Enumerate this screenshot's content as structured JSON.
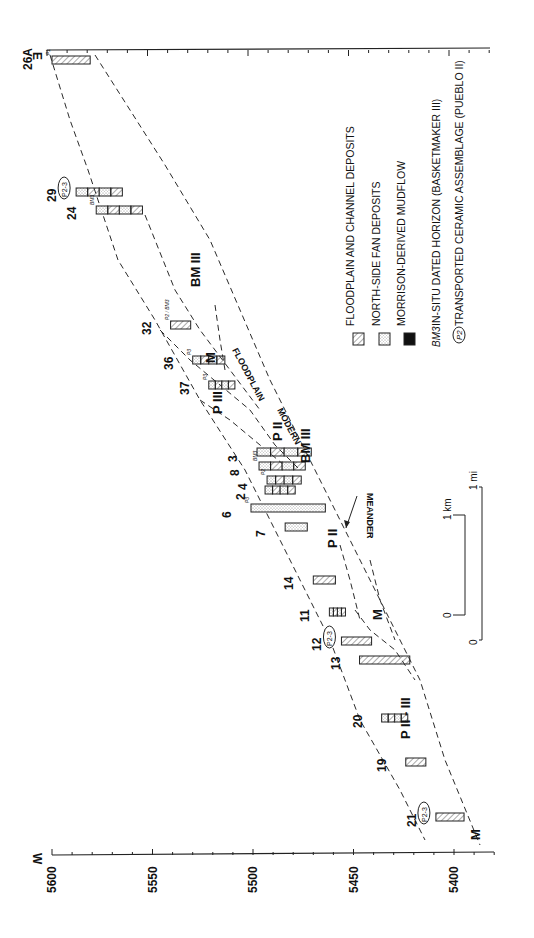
{
  "figure": {
    "orientation": "rotated-90-clockwise",
    "elevation_axis": {
      "tick_labels": [
        "5600",
        "5550",
        "5500",
        "5450",
        "5400"
      ],
      "min": 5380,
      "max": 5600,
      "west_label": "W",
      "east_label": "E"
    },
    "sections": [
      {
        "id": "26A",
        "label": "26A",
        "pos": 60,
        "top": 5600,
        "bottom": 5581,
        "fill": "floodplain",
        "annot": "P1"
      },
      {
        "id": "29",
        "label": "29",
        "pos": 192,
        "top": 5588,
        "bottom": 5565,
        "fill": "mixed",
        "annot": "P2-3"
      },
      {
        "id": "24",
        "label": "24",
        "pos": 210,
        "top": 5578,
        "bottom": 5555,
        "fill": "mixed",
        "annot": "BM3"
      },
      {
        "id": "32",
        "label": "32",
        "pos": 325,
        "top": 5541,
        "bottom": 5531,
        "fill": "floodplain",
        "annot": "P2 / BM3"
      },
      {
        "id": "36",
        "label": "36",
        "pos": 360,
        "top": 5530,
        "bottom": 5514,
        "fill": "mixed",
        "annot": "P3"
      },
      {
        "id": "37",
        "label": "37",
        "pos": 385,
        "top": 5522,
        "bottom": 5509,
        "fill": "mixed",
        "annot": "P3"
      },
      {
        "id": "3",
        "label": "3",
        "pos": 452,
        "top": 5498,
        "bottom": 5471,
        "fill": "mixed"
      },
      {
        "id": "8",
        "label": "8",
        "pos": 466,
        "top": 5497,
        "bottom": 5474,
        "fill": "mixed",
        "annot": "BM3"
      },
      {
        "id": "4",
        "label": "4",
        "pos": 480,
        "top": 5493,
        "bottom": 5476,
        "fill": "mixed",
        "annot": "P2"
      },
      {
        "id": "2",
        "label": "2",
        "pos": 490,
        "top": 5494,
        "bottom": 5479,
        "fill": "mixed"
      },
      {
        "id": "6",
        "label": "6",
        "pos": 508,
        "top": 5501,
        "bottom": 5464,
        "fill": "fan",
        "annot": "P3"
      },
      {
        "id": "7",
        "label": "7",
        "pos": 527,
        "top": 5484,
        "bottom": 5473,
        "fill": "fan"
      },
      {
        "id": "14",
        "label": "14",
        "pos": 580,
        "top": 5470,
        "bottom": 5459,
        "fill": "floodplain"
      },
      {
        "id": "11",
        "label": "11",
        "pos": 612,
        "top": 5462,
        "bottom": 5454,
        "fill": "mixed"
      },
      {
        "id": "12",
        "label": "12",
        "pos": 641,
        "top": 5456,
        "bottom": 5441,
        "fill": "floodplain",
        "annot": "P2-3"
      },
      {
        "id": "13",
        "label": "13",
        "pos": 660,
        "top": 5447,
        "bottom": 5422,
        "fill": "floodplain"
      },
      {
        "id": "20",
        "label": "20",
        "pos": 718,
        "top": 5436,
        "bottom": 5423,
        "fill": "mixed"
      },
      {
        "id": "19",
        "label": "19",
        "pos": 762,
        "top": 5424,
        "bottom": 5414,
        "fill": "floodplain"
      },
      {
        "id": "21",
        "label": "21",
        "pos": 817,
        "top": 5409,
        "bottom": 5395,
        "fill": "floodplain",
        "annot": "P2-3"
      }
    ],
    "unit_labels": [
      {
        "text": "BM III",
        "x": 200,
        "y": 287
      },
      {
        "text": "M",
        "x": 215,
        "y": 363
      },
      {
        "text": "P III",
        "x": 222,
        "y": 414
      },
      {
        "text": "P II",
        "x": 282,
        "y": 441
      },
      {
        "text": "BM III",
        "x": 310,
        "y": 463
      },
      {
        "text": "P II",
        "x": 337,
        "y": 548
      },
      {
        "text": "M",
        "x": 382,
        "y": 620
      },
      {
        "text": "P II - III",
        "x": 410,
        "y": 739
      },
      {
        "text": "M",
        "x": 480,
        "y": 840
      }
    ],
    "feature_labels": {
      "floodplain": "FLOODPLAIN",
      "modern": "MODERN",
      "meander": "MEANDER"
    },
    "legend": {
      "items": [
        {
          "symbol": "floodplain",
          "label": "FLOODPLAIN AND CHANNEL DEPOSITS"
        },
        {
          "symbol": "fan",
          "label": "NORTH-SIDE FAN DEPOSITS"
        },
        {
          "symbol": "mudflow",
          "label": "MORRISON-DERIVED MUDFLOW"
        },
        {
          "symbol": "BM3",
          "label": "IN-SITU DATED HORIZON   (BASKETMAKER III)"
        },
        {
          "symbol": "P2",
          "label": "TRANSPORTED CERAMIC ASSEMBLAGE   (PUEBLO II)"
        }
      ]
    },
    "scale_bar": {
      "km_zero": "0",
      "km_one": "1 km",
      "mi_zero": "0",
      "mi_one": "1 mi"
    },
    "colors": {
      "ink": "#1a1a1a",
      "paper": "#ffffff",
      "hatch": "#555555",
      "stipple": "#8a8a8a"
    }
  },
  "chart_data": {
    "type": "table",
    "xlabel": "Distance W → E (section numbers)",
    "ylabel": "Elevation",
    "ylim": [
      5380,
      5600
    ],
    "y_ticks": [
      5400,
      5450,
      5500,
      5550,
      5600
    ],
    "categories": [
      "21",
      "19",
      "20",
      "13",
      "12",
      "11",
      "14",
      "7",
      "6",
      "2",
      "4",
      "8",
      "3",
      "37",
      "36",
      "32",
      "24",
      "29",
      "26A"
    ],
    "series": [
      {
        "name": "Section top elevation (approx)",
        "values": [
          5409,
          5424,
          5436,
          5447,
          5456,
          5462,
          5470,
          5484,
          5501,
          5494,
          5493,
          5497,
          5498,
          5522,
          5530,
          5541,
          5578,
          5588,
          5600
        ]
      },
      {
        "name": "Section base elevation (approx)",
        "values": [
          5395,
          5414,
          5423,
          5422,
          5441,
          5454,
          5459,
          5473,
          5464,
          5479,
          5476,
          5474,
          5471,
          5509,
          5514,
          5531,
          5555,
          5565,
          5581
        ]
      }
    ],
    "legend": [
      "FLOODPLAIN AND CHANNEL DEPOSITS",
      "NORTH-SIDE FAN DEPOSITS",
      "MORRISON-DERIVED MUDFLOW",
      "BM3 IN-SITU DATED HORIZON (BASKETMAKER III)",
      "P2 TRANSPORTED CERAMIC ASSEMBLAGE (PUEBLO II)"
    ],
    "annotations": [
      "BM III",
      "P III",
      "P II",
      "M",
      "P II - III",
      "MODERN FLOODPLAIN",
      "MEANDER",
      "1 km",
      "1 mi"
    ]
  }
}
